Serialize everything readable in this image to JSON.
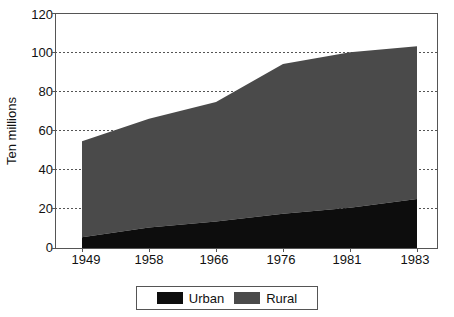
{
  "chart_data": {
    "type": "area",
    "stacked": true,
    "title": "",
    "xlabel": "",
    "ylabel": "Ten millions",
    "categories": [
      "1949",
      "1958",
      "1966",
      "1976",
      "1981",
      "1983"
    ],
    "x_tick_labels": [
      "1949",
      "1958",
      "1966",
      "1976",
      "1981",
      "1983"
    ],
    "y_tick_labels": [
      "0",
      "20",
      "40",
      "60",
      "80",
      "100",
      "120"
    ],
    "y_ticks": [
      0,
      20,
      40,
      60,
      80,
      100,
      120
    ],
    "ylim": [
      0,
      120
    ],
    "grid": "horizontal-dotted",
    "legend_position": "bottom-center",
    "series": [
      {
        "name": "Urban",
        "color": "#0d0d0d",
        "values": [
          5.5,
          10.5,
          13.5,
          17.5,
          20.5,
          25.0
        ]
      },
      {
        "name": "Rural",
        "color": "#4a4a4a",
        "values": [
          49.0,
          55.5,
          61.0,
          76.5,
          79.5,
          78.0
        ]
      }
    ],
    "totals": [
      54.5,
      66.0,
      74.5,
      94.0,
      100.0,
      103.0
    ],
    "legend": [
      {
        "label": "Urban",
        "color": "#0d0d0d"
      },
      {
        "label": "Rural",
        "color": "#4a4a4a"
      }
    ],
    "colors": {
      "urban": "#0d0d0d",
      "rural": "#4a4a4a",
      "axis": "#555555",
      "grid": "#555555",
      "text": "#111111",
      "background": "#ffffff"
    }
  }
}
